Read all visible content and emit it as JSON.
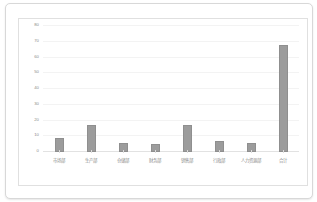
{
  "page": {
    "background_color": "#ffffff",
    "card_border_color": "#d8d8d8"
  },
  "chart": {
    "frame_border_color": "#e0e0e0",
    "plot_background_color": "#ffffff",
    "bar_color": "#9c9c9c",
    "gridline_color": "#f3f3f3",
    "axis_color": "#e2e2e2",
    "tick_label_color": "#8a8a8a"
  },
  "chart_data": {
    "type": "bar",
    "title": "",
    "subtitle": "",
    "xlabel": "",
    "ylabel": "",
    "categories": [
      "市场部",
      "生产部",
      "仓储部",
      "财务部",
      "销售部",
      "行政部",
      "人力资源部",
      "合计"
    ],
    "values": [
      9,
      17,
      6,
      5,
      17,
      7,
      6,
      68
    ],
    "ylim": [
      0,
      80
    ],
    "yticks": [
      0,
      10,
      20,
      30,
      40,
      50,
      60,
      70,
      80
    ],
    "ytick_labels": [
      "0",
      "10",
      "20",
      "30",
      "40",
      "50",
      "60",
      "70",
      "80"
    ],
    "grid": true,
    "legend": false,
    "legend_position": "none",
    "series": [
      {
        "name": "",
        "values": [
          9,
          17,
          6,
          5,
          17,
          7,
          6,
          68
        ]
      }
    ]
  }
}
